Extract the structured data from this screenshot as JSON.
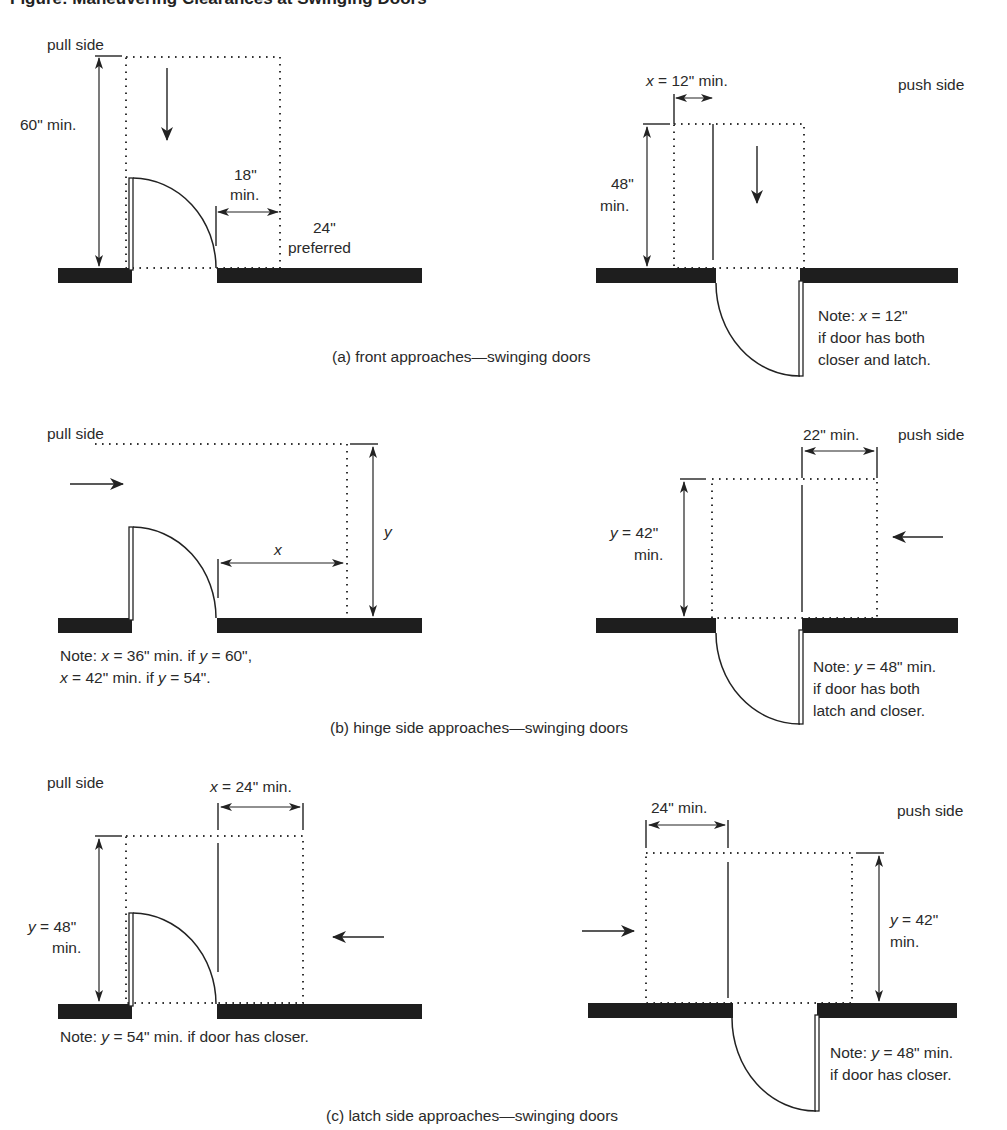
{
  "heading": "Figure: Maneuvering Clearances at Swinging Doors",
  "panels": {
    "a": {
      "caption": "(a) front approaches—swinging doors",
      "pull": {
        "side_label": "pull side",
        "depth_label": "60\" min.",
        "latch_clear_line1": "18\"",
        "latch_clear_line2": "min.",
        "preferred_line1": "24\"",
        "preferred_line2": "preferred"
      },
      "push": {
        "side_label": "push side",
        "x_var": "x",
        "x_rest": " = 12\" min.",
        "depth_line1": "48\"",
        "depth_line2": "min.",
        "note_prefix": "Note: ",
        "note_var": "x",
        "note_rest": " = 12\"",
        "note_line2": "if door has both",
        "note_line3": "closer and latch."
      }
    },
    "b": {
      "caption": "(b) hinge side approaches—swinging doors",
      "pull": {
        "side_label": "pull side",
        "x_label": "x",
        "y_label": "y",
        "note_line1_prefix": "Note: ",
        "note_line1_x": "x",
        "note_line1_mid": " = 36\" min. if ",
        "note_line1_y": "y",
        "note_line1_end": " = 60\",",
        "note_line2_x": "x",
        "note_line2_mid": " = 42\" min. if ",
        "note_line2_y": "y",
        "note_line2_end": " = 54\"."
      },
      "push": {
        "side_label": "push side",
        "width_label": "22\" min.",
        "y_var": "y",
        "y_rest": " = 42\"",
        "y_line2": "min.",
        "note_prefix": "Note: ",
        "note_var": "y",
        "note_rest": " = 48\" min.",
        "note_line2": "if door has both",
        "note_line3": "latch and closer."
      }
    },
    "c": {
      "caption": "(c) latch side approaches—swinging doors",
      "pull": {
        "side_label": "pull side",
        "x_var": "x",
        "x_rest": " = 24\" min.",
        "y_var": "y",
        "y_rest": " = 48\"",
        "y_line2": "min.",
        "note_prefix": "Note: ",
        "note_var": "y",
        "note_rest": " = 54\" min. if door has closer."
      },
      "push": {
        "side_label": "push side",
        "width_label": "24\" min.",
        "y_var": "y",
        "y_rest": " = 42\"",
        "y_line2": "min.",
        "note_prefix": "Note: ",
        "note_var": "y",
        "note_rest": " = 48\" min.",
        "note_line2": "if door has closer."
      }
    }
  }
}
